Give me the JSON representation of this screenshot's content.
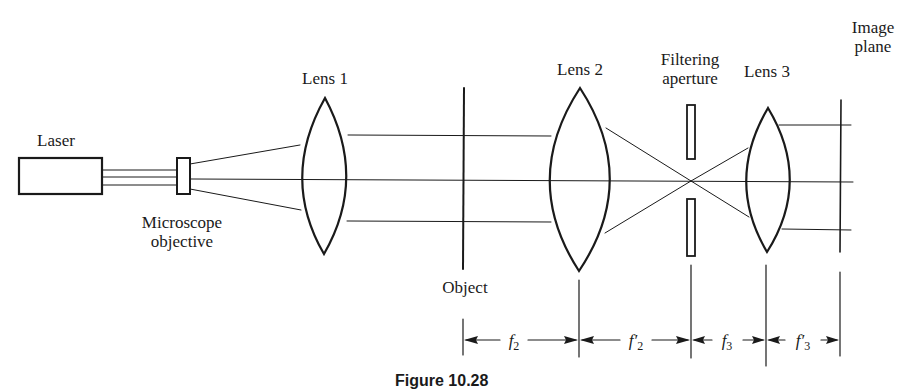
{
  "diagram": {
    "labels": {
      "laser": "Laser",
      "microscope_objective_line1": "Microscope",
      "microscope_objective_line2": "objective",
      "lens1": "Lens 1",
      "object": "Object",
      "lens2": "Lens 2",
      "filtering_aperture_line1": "Filtering",
      "filtering_aperture_line2": "aperture",
      "lens3": "Lens 3",
      "image_plane_line1": "Image",
      "image_plane_line2": "plane"
    },
    "dimensions": [
      {
        "symbol": "f",
        "prime": "",
        "subscript": "2"
      },
      {
        "symbol": "f",
        "prime": "′",
        "subscript": "2"
      },
      {
        "symbol": "f",
        "prime": "",
        "subscript": "3"
      },
      {
        "symbol": "f",
        "prime": "′",
        "subscript": "3"
      }
    ],
    "caption": "Figure 10.28"
  },
  "colors": {
    "ink": "#1a1a1a",
    "background": "#ffffff"
  }
}
